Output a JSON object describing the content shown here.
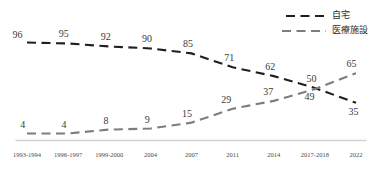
{
  "chart_data": {
    "type": "line",
    "title": "",
    "subtitle": "",
    "xlabel": "",
    "ylabel": "",
    "categories": [
      "1993-1994",
      "1996-1997",
      "1999-2000",
      "2004",
      "2007",
      "2011",
      "2014",
      "2017-2018",
      "2022"
    ],
    "series": [
      {
        "name": "自宅",
        "values": [
          96,
          95,
          92,
          90,
          85,
          71,
          62,
          50,
          35
        ],
        "color": "#1f1f1f",
        "style": "dashed"
      },
      {
        "name": "医療施設",
        "values": [
          4,
          4,
          8,
          9,
          15,
          29,
          37,
          49,
          65
        ],
        "color": "#7a7a7a",
        "style": "dashed"
      }
    ],
    "ylim": [
      0,
      100
    ],
    "grid": false,
    "legend_position": "top-right",
    "axis_color": "#cfcfcf",
    "label_color": "#3a3a3a"
  },
  "legend": {
    "items": [
      {
        "label": "自宅",
        "color": "#1f1f1f"
      },
      {
        "label": "医療施設",
        "color": "#7a7a7a"
      }
    ]
  },
  "axis": {
    "ticks": [
      "1993-1994",
      "1996-1997",
      "1999-2000",
      "2004",
      "2007",
      "2011",
      "2014",
      "2017-2018",
      "2022"
    ]
  },
  "labels": {
    "home": [
      "96",
      "95",
      "92",
      "90",
      "85",
      "71",
      "62",
      "50",
      "35"
    ],
    "facility": [
      "4",
      "4",
      "8",
      "9",
      "15",
      "29",
      "37",
      "49",
      "65"
    ]
  }
}
